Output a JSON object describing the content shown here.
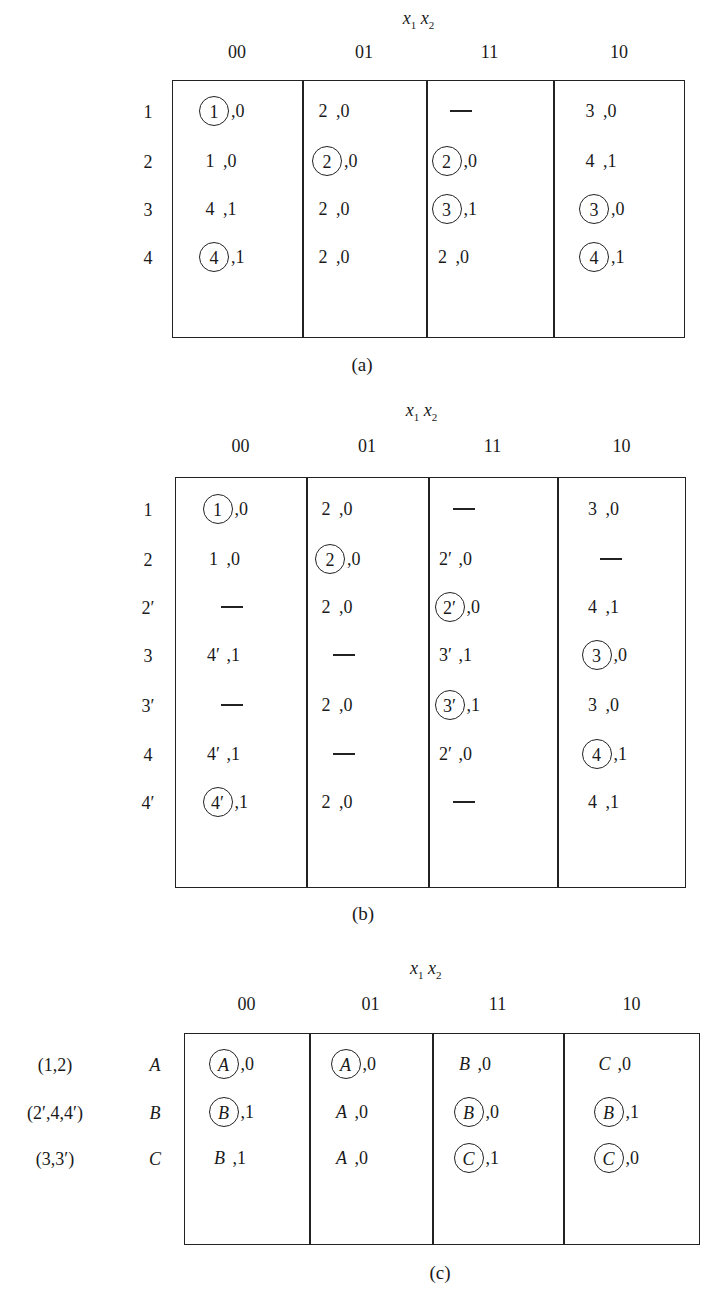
{
  "tables": {
    "a": {
      "var_label": "x1 x2",
      "columns": [
        "00",
        "01",
        "11",
        "10"
      ],
      "rows": [
        "1",
        "2",
        "3",
        "4"
      ],
      "cells": [
        [
          {
            "s": "1",
            "o": "0",
            "c": true
          },
          {
            "s": "2",
            "o": "0",
            "c": false
          },
          {
            "s": "—",
            "o": "",
            "c": false
          },
          {
            "s": "3",
            "o": "0",
            "c": false
          }
        ],
        [
          {
            "s": "1",
            "o": "0",
            "c": false
          },
          {
            "s": "2",
            "o": "0",
            "c": true
          },
          {
            "s": "2",
            "o": "0",
            "c": true
          },
          {
            "s": "4",
            "o": "1",
            "c": false
          }
        ],
        [
          {
            "s": "4",
            "o": "1",
            "c": false
          },
          {
            "s": "2",
            "o": "0",
            "c": false
          },
          {
            "s": "3",
            "o": "1",
            "c": true
          },
          {
            "s": "3",
            "o": "0",
            "c": true
          }
        ],
        [
          {
            "s": "4",
            "o": "1",
            "c": true
          },
          {
            "s": "2",
            "o": "0",
            "c": false
          },
          {
            "s": "2",
            "o": "0",
            "c": false
          },
          {
            "s": "4",
            "o": "1",
            "c": true
          }
        ]
      ],
      "caption": "(a)"
    },
    "b": {
      "var_label": "x1 x2",
      "columns": [
        "00",
        "01",
        "11",
        "10"
      ],
      "rows": [
        "1",
        "2",
        "2′",
        "3",
        "3′",
        "4",
        "4′"
      ],
      "cells": [
        [
          {
            "s": "1",
            "o": "0",
            "c": true
          },
          {
            "s": "2",
            "o": "0",
            "c": false
          },
          {
            "s": "—",
            "o": "",
            "c": false
          },
          {
            "s": "3",
            "o": "0",
            "c": false
          }
        ],
        [
          {
            "s": "1",
            "o": "0",
            "c": false
          },
          {
            "s": "2",
            "o": "0",
            "c": true
          },
          {
            "s": "2′",
            "o": "0",
            "c": false
          },
          {
            "s": "—",
            "o": "",
            "c": false
          }
        ],
        [
          {
            "s": "—",
            "o": "",
            "c": false
          },
          {
            "s": "2",
            "o": "0",
            "c": false
          },
          {
            "s": "2′",
            "o": "0",
            "c": true
          },
          {
            "s": "4",
            "o": "1",
            "c": false
          }
        ],
        [
          {
            "s": "4′",
            "o": "1",
            "c": false
          },
          {
            "s": "—",
            "o": "",
            "c": false
          },
          {
            "s": "3′",
            "o": "1",
            "c": false
          },
          {
            "s": "3",
            "o": "0",
            "c": true
          }
        ],
        [
          {
            "s": "—",
            "o": "",
            "c": false
          },
          {
            "s": "2",
            "o": "0",
            "c": false
          },
          {
            "s": "3′",
            "o": "1",
            "c": true
          },
          {
            "s": "3",
            "o": "0",
            "c": false
          }
        ],
        [
          {
            "s": "4′",
            "o": "1",
            "c": false
          },
          {
            "s": "—",
            "o": "",
            "c": false
          },
          {
            "s": "2′",
            "o": "0",
            "c": false
          },
          {
            "s": "4",
            "o": "1",
            "c": true
          }
        ],
        [
          {
            "s": "4′",
            "o": "1",
            "c": true
          },
          {
            "s": "2",
            "o": "0",
            "c": false
          },
          {
            "s": "—",
            "o": "",
            "c": false
          },
          {
            "s": "4",
            "o": "1",
            "c": false
          }
        ]
      ],
      "caption": "(b)"
    },
    "c": {
      "var_label": "x1 x2",
      "columns": [
        "00",
        "01",
        "11",
        "10"
      ],
      "row_groups": [
        "(1,2)",
        "(2′,4,4′)",
        "(3,3′)"
      ],
      "rows": [
        "A",
        "B",
        "C"
      ],
      "cells": [
        [
          {
            "s": "A",
            "o": "0",
            "c": true
          },
          {
            "s": "A",
            "o": "0",
            "c": true
          },
          {
            "s": "B",
            "o": "0",
            "c": false
          },
          {
            "s": "C",
            "o": "0",
            "c": false
          }
        ],
        [
          {
            "s": "B",
            "o": "1",
            "c": true
          },
          {
            "s": "A",
            "o": "0",
            "c": false
          },
          {
            "s": "B",
            "o": "0",
            "c": true
          },
          {
            "s": "B",
            "o": "1",
            "c": true
          }
        ],
        [
          {
            "s": "B",
            "o": "1",
            "c": false
          },
          {
            "s": "A",
            "o": "0",
            "c": false
          },
          {
            "s": "C",
            "o": "1",
            "c": true
          },
          {
            "s": "C",
            "o": "0",
            "c": true
          }
        ]
      ],
      "caption": "(c)"
    }
  }
}
